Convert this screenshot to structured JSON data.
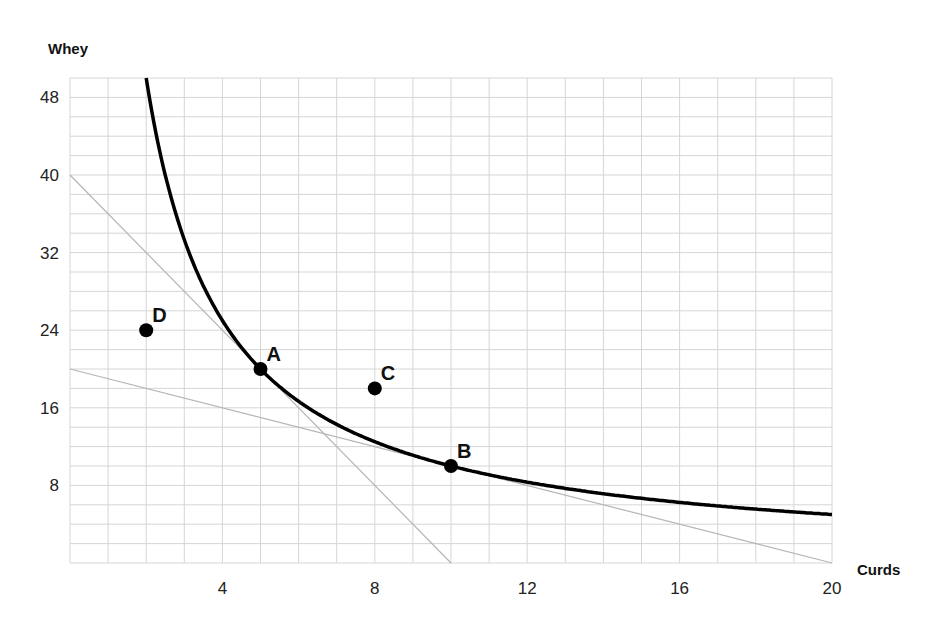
{
  "chart_data": {
    "type": "line",
    "title": "",
    "xlabel": "Curds",
    "ylabel": "Whey",
    "xlim": [
      0,
      20
    ],
    "ylim": [
      0,
      50
    ],
    "grid": true,
    "x_grid_step": 1,
    "y_grid_step": 2,
    "x_ticks": [
      4,
      8,
      12,
      16,
      20
    ],
    "y_ticks": [
      8,
      16,
      24,
      32,
      40,
      48
    ],
    "series": [
      {
        "name": "Indifference curve (x·y = 100)",
        "style": "thick-black-curve",
        "function": "y = 100 / x",
        "x": [
          2,
          2.5,
          3,
          4,
          5,
          6,
          7,
          8,
          9,
          10,
          12,
          14,
          16,
          18,
          20
        ],
        "y": [
          50,
          40,
          33.3,
          25,
          20,
          16.7,
          14.3,
          12.5,
          11.1,
          10,
          8.3,
          7.1,
          6.25,
          5.6,
          5
        ]
      },
      {
        "name": "Budget line (steep)",
        "style": "thin-gray-line",
        "x": [
          0,
          10
        ],
        "y": [
          40,
          0
        ]
      },
      {
        "name": "Budget line (shallow)",
        "style": "thin-gray-line",
        "x": [
          0,
          20
        ],
        "y": [
          20,
          0
        ]
      }
    ],
    "points": [
      {
        "label": "A",
        "x": 5,
        "y": 20
      },
      {
        "label": "B",
        "x": 10,
        "y": 10
      },
      {
        "label": "C",
        "x": 8,
        "y": 18
      },
      {
        "label": "D",
        "x": 2,
        "y": 24
      }
    ],
    "colors": {
      "curve": "#000000",
      "budget_line": "#b5b5b5",
      "grid": "#d6d6d6",
      "point": "#000000"
    }
  }
}
